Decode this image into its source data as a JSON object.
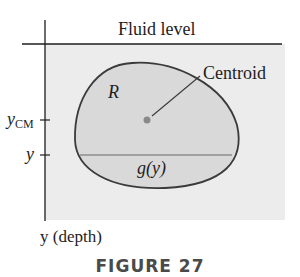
{
  "diagram": {
    "fluid_level_label": "Fluid level",
    "region_label": "R",
    "centroid_label": "Centroid",
    "y_cm_label_main": "y",
    "y_cm_label_sub": "CM",
    "y_label": "y",
    "chord_label": "g(y)",
    "axis_label": "y (depth)",
    "caption": "FIGURE 27",
    "colors": {
      "panel_background": "#ececec",
      "region_fill": "#d9d9d9",
      "region_stroke": "#3a3a3a",
      "centroid_dot": "#8a8a8a",
      "chord_line": "#8c8c8c",
      "axis": "#1e1e1e"
    }
  }
}
